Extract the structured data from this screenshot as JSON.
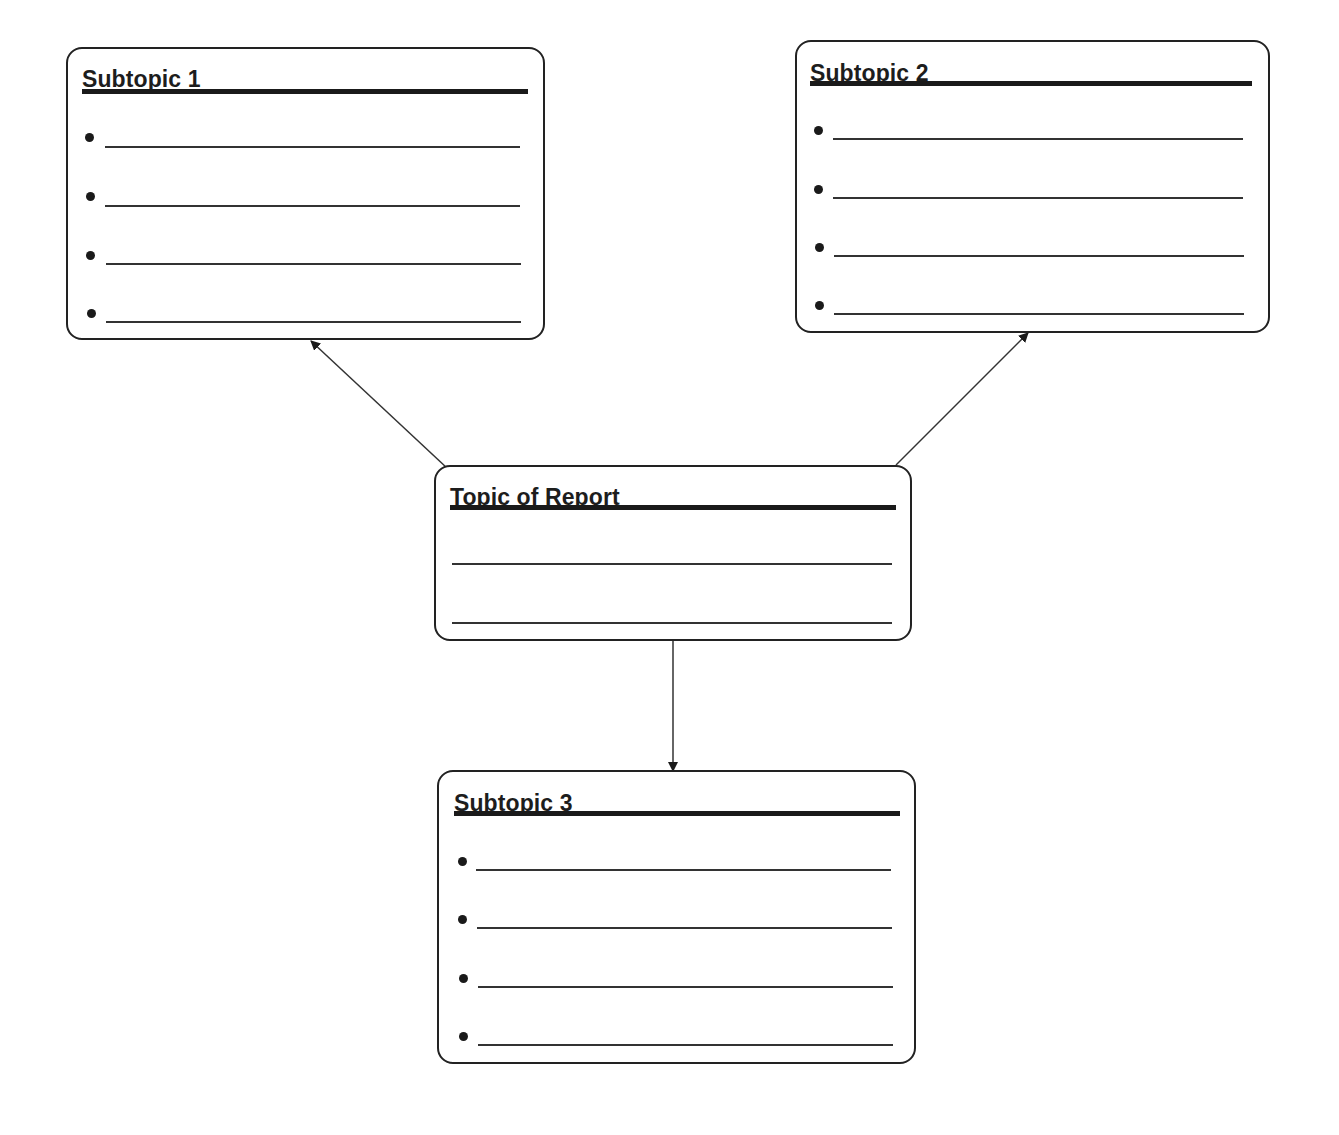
{
  "diagram": {
    "type": "report-outline-graphic-organizer",
    "central": {
      "title": "Topic of Report",
      "lines": 2
    },
    "subtopics": [
      {
        "title": "Subtopic 1",
        "bullets": [
          "",
          "",
          "",
          ""
        ]
      },
      {
        "title": "Subtopic 2",
        "bullets": [
          "",
          "",
          "",
          ""
        ]
      },
      {
        "title": "Subtopic 3",
        "bullets": [
          "",
          "",
          "",
          ""
        ]
      }
    ],
    "edges": [
      {
        "from": "Topic of Report",
        "to": "Subtopic 1",
        "direction": "up-left"
      },
      {
        "from": "Topic of Report",
        "to": "Subtopic 2",
        "direction": "up-right"
      },
      {
        "from": "Topic of Report",
        "to": "Subtopic 3",
        "direction": "down"
      }
    ],
    "colors": {
      "stroke": "#222222",
      "background": "#ffffff"
    }
  }
}
